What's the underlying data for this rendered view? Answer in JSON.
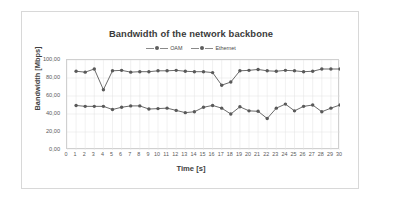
{
  "chart_data": {
    "type": "line",
    "title": "Bandwidth of the network backbone",
    "xlabel": "Time [s]",
    "ylabel": "Bandwidth [Mbps]",
    "xlim": [
      0,
      30
    ],
    "ylim": [
      0,
      100
    ],
    "ytick_labels": [
      "0,00",
      "20,00",
      "40,00",
      "60,00",
      "80,00",
      "100,00"
    ],
    "ytick_values": [
      0,
      20,
      40,
      60,
      80,
      100
    ],
    "xtick_labels": [
      "0",
      "1",
      "2",
      "3",
      "4",
      "5",
      "6",
      "7",
      "8",
      "9",
      "10",
      "11",
      "12",
      "13",
      "14",
      "15",
      "16",
      "17",
      "18",
      "19",
      "20",
      "21",
      "22",
      "23",
      "24",
      "25",
      "26",
      "27",
      "28",
      "29",
      "30"
    ],
    "grid": true,
    "legend_position": "top-center",
    "x": [
      1,
      2,
      3,
      4,
      5,
      6,
      7,
      8,
      9,
      10,
      11,
      12,
      13,
      14,
      15,
      16,
      17,
      18,
      19,
      20,
      21,
      22,
      23,
      24,
      25,
      26,
      27,
      28,
      29,
      30
    ],
    "series": [
      {
        "name": "OAM",
        "color": "#595959",
        "values": [
          87.5,
          86.5,
          90.0,
          67.0,
          88.0,
          88.5,
          86.5,
          87.0,
          87.0,
          88.0,
          88.0,
          88.5,
          87.5,
          87.0,
          87.0,
          86.0,
          72.0,
          75.5,
          88.0,
          88.5,
          89.5,
          88.0,
          87.5,
          88.5,
          88.0,
          87.0,
          87.5,
          90.0,
          90.0,
          90.0
        ]
      },
      {
        "name": "Ethernet",
        "color": "#595959",
        "values": [
          49.5,
          48.5,
          48.5,
          48.5,
          45.0,
          47.5,
          49.0,
          49.0,
          45.5,
          46.0,
          46.5,
          44.0,
          41.5,
          42.5,
          47.5,
          49.5,
          46.5,
          40.0,
          48.0,
          43.5,
          43.0,
          35.0,
          46.5,
          51.0,
          43.5,
          48.5,
          50.0,
          42.5,
          46.5,
          50.0
        ]
      }
    ]
  }
}
